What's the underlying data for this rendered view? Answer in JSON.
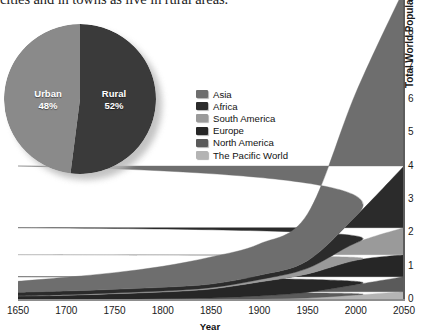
{
  "caption": {
    "text": "cities and in towns as live in rural areas."
  },
  "pie": {
    "title": "",
    "slices": [
      {
        "label": "Urban",
        "percent_label": "48%",
        "value": 48,
        "color": "#8a8a8a"
      },
      {
        "label": "Rural",
        "percent_label": "52%",
        "value": 52,
        "color": "#3a3a3a"
      }
    ]
  },
  "legend": {
    "items": [
      {
        "label": "Asia",
        "color": "#6e6e6e"
      },
      {
        "label": "Africa",
        "color": "#2b2b2b"
      },
      {
        "label": "South America",
        "color": "#9a9a9a"
      },
      {
        "label": "Europe",
        "color": "#262626"
      },
      {
        "label": "North America",
        "color": "#5a5a5a"
      },
      {
        "label": "The Pacific World",
        "color": "#b4b4b4"
      }
    ]
  },
  "axes": {
    "y_title_strong": "Total World Population",
    "y_title_rest": " (in billions)",
    "y_ticks": [
      "0",
      "1",
      "2",
      "3",
      "4",
      "5",
      "6",
      "7",
      "8"
    ],
    "x_title": "Year",
    "x_ticks": [
      "1650",
      "1700",
      "1750",
      "1800",
      "1850",
      "1900",
      "1950",
      "2000",
      "2050"
    ]
  },
  "chart_data": {
    "type": "area",
    "title": "",
    "xlabel": "Year",
    "ylabel": "Total World Population (in billions)",
    "xlim": [
      1650,
      2050
    ],
    "ylim": [
      0,
      9
    ],
    "grid": false,
    "stacked": true,
    "legend_position": "inside-top-center",
    "x": [
      1650,
      1700,
      1750,
      1800,
      1850,
      1900,
      1950,
      2000,
      2050
    ],
    "series": [
      {
        "name": "The Pacific World",
        "color": "#b4b4b4",
        "values": [
          0.01,
          0.01,
          0.02,
          0.02,
          0.02,
          0.03,
          0.06,
          0.15,
          0.25
        ]
      },
      {
        "name": "North America",
        "color": "#5a5a5a",
        "values": [
          0.01,
          0.01,
          0.01,
          0.02,
          0.04,
          0.09,
          0.17,
          0.31,
          0.45
        ]
      },
      {
        "name": "Europe",
        "color": "#262626",
        "values": [
          0.1,
          0.12,
          0.16,
          0.2,
          0.27,
          0.42,
          0.55,
          0.73,
          0.66
        ]
      },
      {
        "name": "South America",
        "color": "#9a9a9a",
        "values": [
          0.01,
          0.02,
          0.02,
          0.03,
          0.04,
          0.07,
          0.17,
          0.52,
          0.81
        ]
      },
      {
        "name": "Africa",
        "color": "#2b2b2b",
        "values": [
          0.1,
          0.11,
          0.11,
          0.11,
          0.11,
          0.13,
          0.23,
          0.8,
          1.85
        ]
      },
      {
        "name": "Asia",
        "color": "#6e6e6e",
        "values": [
          0.33,
          0.41,
          0.5,
          0.63,
          0.81,
          0.94,
          1.4,
          3.7,
          5.3
        ]
      }
    ],
    "pie_inset": {
      "type": "pie",
      "labels": [
        "Urban",
        "Rural"
      ],
      "values": [
        48,
        52
      ]
    }
  }
}
